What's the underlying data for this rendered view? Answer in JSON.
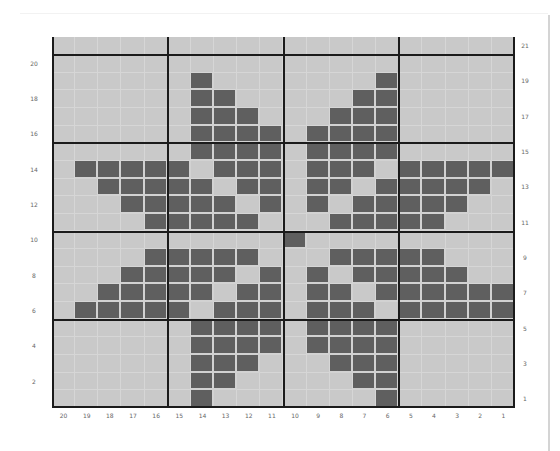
{
  "chart": {
    "columns": 20,
    "rows": 21,
    "colors": {
      "empty": "#c9c9c9",
      "filled": "#5f5f5f",
      "thick_line": "#1b1b1b",
      "grid_line": "#d6d6d6"
    },
    "left_labels": [
      {
        "row": 20,
        "label": "20"
      },
      {
        "row": 18,
        "label": "18"
      },
      {
        "row": 16,
        "label": "16"
      },
      {
        "row": 14,
        "label": "14"
      },
      {
        "row": 12,
        "label": "12"
      },
      {
        "row": 10,
        "label": "10"
      },
      {
        "row": 8,
        "label": "8"
      },
      {
        "row": 6,
        "label": "6"
      },
      {
        "row": 4,
        "label": "4"
      },
      {
        "row": 2,
        "label": "2"
      }
    ],
    "right_labels": [
      {
        "row": 21,
        "label": "21"
      },
      {
        "row": 19,
        "label": "19"
      },
      {
        "row": 17,
        "label": "17"
      },
      {
        "row": 15,
        "label": "15"
      },
      {
        "row": 13,
        "label": "13"
      },
      {
        "row": 11,
        "label": "11"
      },
      {
        "row": 9,
        "label": "9"
      },
      {
        "row": 7,
        "label": "7"
      },
      {
        "row": 5,
        "label": "5"
      },
      {
        "row": 3,
        "label": "3"
      },
      {
        "row": 1,
        "label": "1"
      }
    ],
    "bottom_labels": [
      "20",
      "19",
      "18",
      "17",
      "16",
      "15",
      "14",
      "13",
      "12",
      "11",
      "10",
      "9",
      "8",
      "7",
      "6",
      "5",
      "4",
      "3",
      "2",
      "1"
    ],
    "filled_cells_by_row": {
      "21": [],
      "20": [],
      "19": [
        14,
        6
      ],
      "18": [
        14,
        13,
        7,
        6
      ],
      "17": [
        14,
        13,
        12,
        8,
        7,
        6
      ],
      "16": [
        14,
        13,
        12,
        11,
        9,
        8,
        7,
        6
      ],
      "15": [
        14,
        13,
        12,
        11,
        9,
        8,
        7,
        6
      ],
      "14": [
        19,
        18,
        17,
        16,
        15,
        13,
        12,
        11,
        9,
        8,
        7,
        5,
        4,
        3,
        2,
        1
      ],
      "13": [
        18,
        17,
        16,
        15,
        14,
        12,
        11,
        9,
        8,
        6,
        5,
        4,
        3,
        2
      ],
      "12": [
        17,
        16,
        15,
        14,
        13,
        11,
        9,
        7,
        6,
        5,
        4,
        3
      ],
      "11": [
        16,
        15,
        14,
        13,
        12,
        8,
        7,
        6,
        5,
        4
      ],
      "10": [
        10
      ],
      "9": [
        16,
        15,
        14,
        13,
        12,
        8,
        7,
        6,
        5,
        4
      ],
      "8": [
        17,
        16,
        15,
        14,
        13,
        11,
        9,
        7,
        6,
        5,
        4,
        3
      ],
      "7": [
        18,
        17,
        16,
        15,
        14,
        12,
        11,
        9,
        8,
        6,
        5,
        4,
        3,
        2,
        1
      ],
      "6": [
        19,
        18,
        17,
        16,
        15,
        13,
        12,
        11,
        9,
        8,
        7,
        5,
        4,
        3,
        2,
        1
      ],
      "5": [
        14,
        13,
        12,
        11,
        9,
        8,
        7,
        6
      ],
      "4": [
        14,
        13,
        12,
        11,
        9,
        8,
        7,
        6
      ],
      "3": [
        14,
        13,
        12,
        8,
        7,
        6
      ],
      "2": [
        14,
        13,
        7,
        6
      ],
      "1": [
        14,
        6
      ]
    }
  }
}
